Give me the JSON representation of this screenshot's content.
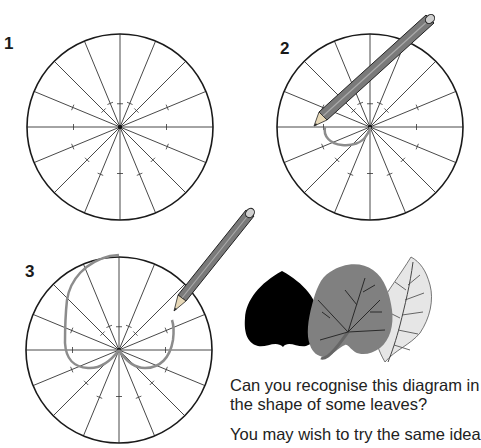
{
  "steps": [
    {
      "number": "1",
      "center": [
        120,
        127
      ],
      "radius": 93,
      "spokes": 16,
      "curve": "none",
      "pencil": false
    },
    {
      "number": "2",
      "center": [
        370,
        127
      ],
      "radius": 93,
      "spokes": 16,
      "curve": "partial",
      "pencil": true
    },
    {
      "number": "3",
      "center": [
        119,
        350
      ],
      "radius": 93,
      "spokes": 16,
      "curve": "heart",
      "pencil": true
    }
  ],
  "leaves": {
    "silhouette_color": "#000000",
    "dark_leaf_color": "#808080",
    "light_leaf_color": "#e6e6e6"
  },
  "text": {
    "question": "Can you recognise this diagram in the shape of some leaves?",
    "question_line1": "Can you recognise this diagram in",
    "question_line2": "the shape of some leaves?",
    "suggestion": "You may wish to try the same idea"
  },
  "colors": {
    "circle_stroke": "#1a1a1a",
    "spoke_stroke": "#333333",
    "curve_stroke": "#8c8c8c",
    "pencil_body": "#7a7a7a"
  }
}
